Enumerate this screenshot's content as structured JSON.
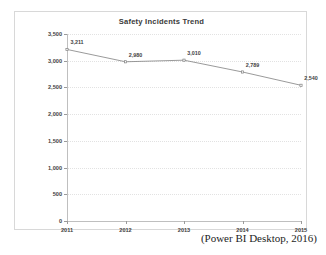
{
  "chart_data": {
    "type": "line",
    "title": "Safety Incidents Trend",
    "xlabel": "",
    "ylabel": "",
    "categories": [
      "2011",
      "2012",
      "2013",
      "2014",
      "2015"
    ],
    "values": [
      3211,
      2980,
      3010,
      2789,
      2540
    ],
    "point_labels": [
      "3,211",
      "2,980",
      "3,010",
      "2,789",
      "2,540"
    ],
    "ylim": [
      0,
      3500
    ],
    "y_ticks": [
      0,
      500,
      1000,
      1500,
      2000,
      2500,
      3000,
      3500
    ],
    "y_tick_labels": [
      "0",
      "500",
      "1,000",
      "1,500",
      "2,000",
      "2,500",
      "3,000",
      "3,500"
    ],
    "grid": true,
    "legend": false,
    "legend_position": "none",
    "series": [
      {
        "name": "Safety Incidents",
        "values": [
          3211,
          2980,
          3010,
          2789,
          2540
        ],
        "line_color": "#808080",
        "marker": "square",
        "marker_color": "#808080"
      }
    ],
    "colors": {
      "line": "#808080",
      "grid": "#e2e2e2",
      "axis": "#bfbfbf",
      "frame": "#d8d8d8",
      "text": "#3f3f3f",
      "title": "#3a3a3a",
      "background": "#ffffff"
    }
  },
  "caption": {
    "source": "(Power BI Desktop, 2016)"
  }
}
